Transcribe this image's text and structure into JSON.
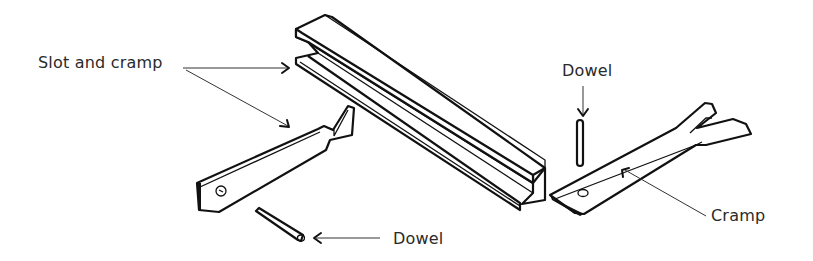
{
  "diagram": {
    "type": "technical-illustration",
    "background": "#ffffff",
    "ink": "#111111",
    "labels": {
      "slot_and_cramp": "Slot and cramp",
      "dowel_left": "Dowel",
      "dowel_right": "Dowel",
      "cramp": "Cramp"
    },
    "parts": [
      {
        "id": "slotted-rail",
        "description": "Long rail with slot along its face"
      },
      {
        "id": "slot-cramp",
        "description": "Flat cramp with dovetail-shaped end and hole"
      },
      {
        "id": "dowel-left",
        "description": "Short cylindrical dowel pin"
      },
      {
        "id": "dowel-right",
        "description": "Vertical dowel pin"
      },
      {
        "id": "fork-cramp",
        "description": "Flat cramp with forked end and hole"
      }
    ]
  }
}
